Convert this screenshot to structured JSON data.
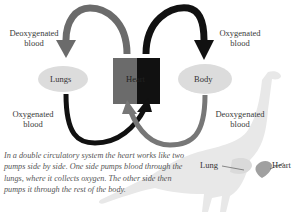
{
  "diagram": {
    "labels": {
      "top_left": "Deoxygenated blood",
      "top_right": "Oxygenated blood",
      "bottom_left": "Oxygenated blood",
      "bottom_right": "Deoxygenated blood",
      "lungs": "Lungs",
      "heart": "Heart",
      "body": "Body"
    },
    "dinosaur": {
      "lung_label": "Lung",
      "heart_label": "Heart"
    },
    "caption": "In a double circulatory system the heart works like two pumps side by side. One side pumps blood through the lungs, where it collects oxygen. The other side then pumps it through the rest of the body.",
    "colors": {
      "deoxygenated": "#6b6b6b",
      "oxygenated": "#111111",
      "ellipse": "#dcdcdc",
      "dinosaur": "#e6e6e6",
      "heart_shape": "#a0a0a0"
    }
  }
}
